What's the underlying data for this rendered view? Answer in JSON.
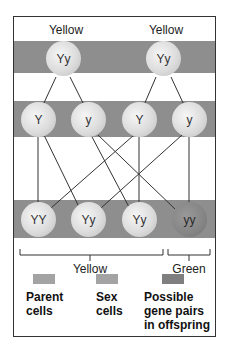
{
  "parents": [
    {
      "phenotype": "Yellow",
      "genotype": "Yy"
    },
    {
      "phenotype": "Yellow",
      "genotype": "Yy"
    }
  ],
  "sex_cells": [
    "Y",
    "y",
    "Y",
    "y"
  ],
  "offspring": [
    {
      "genotype": "YY",
      "color": "yellow"
    },
    {
      "genotype": "Yy",
      "color": "yellow"
    },
    {
      "genotype": "Yy",
      "color": "yellow"
    },
    {
      "genotype": "yy",
      "color": "green"
    }
  ],
  "offspring_groups": {
    "yellow_label": "Yellow",
    "green_label": "Green"
  },
  "legend": [
    {
      "label_line1": "Parent",
      "label_line2": "cells",
      "label_line3": "",
      "swatch_color": "#a3a3a3"
    },
    {
      "label_line1": "Sex",
      "label_line2": "cells",
      "label_line3": "",
      "swatch_color": "#a3a3a3"
    },
    {
      "label_line1": "Possible",
      "label_line2": "gene pairs",
      "label_line3": "in offspring",
      "swatch_color": "#7f7f7f"
    }
  ],
  "colors": {
    "band": "#8e8e8e",
    "cell": "#dcdcdc",
    "green_cell": "#858585"
  }
}
